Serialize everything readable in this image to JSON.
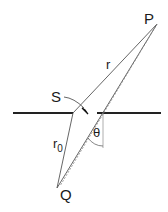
{
  "diagram": {
    "labels": {
      "P": "P",
      "Q": "Q",
      "S": "S",
      "r": "r",
      "r0_main": "r",
      "r0_sub": "0",
      "theta": "θ"
    },
    "colors": {
      "screen": "#222222",
      "ray": "#555555",
      "dashed": "#888888",
      "text": "#1a1a1a"
    }
  }
}
